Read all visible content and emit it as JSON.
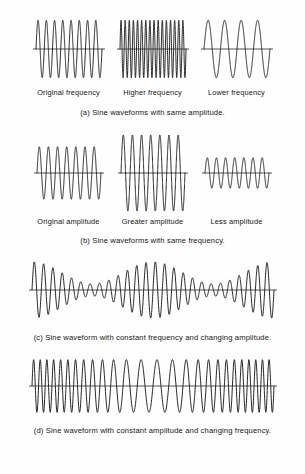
{
  "figure": {
    "ink_color": "#1a1a1a",
    "background_color": "#fefefe",
    "axis_color": "#2b2b2b"
  },
  "chart_data": {
    "type": "line",
    "grid": false,
    "legend": "none",
    "axis_style": "horizontal zero-line only, no ticks, no tick labels",
    "xlabel": "",
    "ylabel": "",
    "panels": [
      {
        "id": "a",
        "caption": "(a) Sine waveforms with same amplitude.",
        "shared_property": "amplitude",
        "varied_property": "frequency",
        "plots": [
          {
            "label": "Original frequency",
            "waveform": "sine",
            "cycles": 8,
            "amplitude": 1.0,
            "ylim": [
              -1.15,
              1.15
            ],
            "width": 74,
            "height": 70
          },
          {
            "label": "Higher frequency",
            "waveform": "sine",
            "cycles": 16,
            "amplitude": 1.0,
            "ylim": [
              -1.15,
              1.15
            ],
            "width": 74,
            "height": 70
          },
          {
            "label": "Lower frequency",
            "waveform": "sine",
            "cycles": 4,
            "amplitude": 1.0,
            "ylim": [
              -1.15,
              1.15
            ],
            "width": 74,
            "height": 70
          }
        ]
      },
      {
        "id": "b",
        "caption": "(b) Sine waveforms with same frequency.",
        "shared_property": "frequency",
        "varied_property": "amplitude",
        "plots": [
          {
            "label": "Original amplitude",
            "waveform": "sine",
            "cycles": 7,
            "amplitude": 1.0,
            "ylim": [
              -1.45,
              1.45
            ],
            "width": 72,
            "height": 80
          },
          {
            "label": "Greater amplitude",
            "waveform": "sine",
            "cycles": 7,
            "amplitude": 1.45,
            "ylim": [
              -1.45,
              1.45
            ],
            "width": 72,
            "height": 80
          },
          {
            "label": "Less amplitude",
            "waveform": "sine",
            "cycles": 7,
            "amplitude": 0.58,
            "ylim": [
              -1.45,
              1.45
            ],
            "width": 72,
            "height": 80
          }
        ]
      },
      {
        "id": "c",
        "caption": "(c) Sine waveform with constant frequency and changing amplitude.",
        "shared_property": "frequency",
        "varied_property": "amplitude",
        "plots": [
          {
            "label": "",
            "waveform": "amplitude-modulated-sine",
            "carrier_cycles": 26,
            "envelope_cycles": 2,
            "envelope_min": 0.22,
            "envelope_max": 1.0,
            "amplitude": 1.0,
            "ylim": [
              -1.1,
              1.1
            ],
            "width": 250,
            "height": 66
          }
        ]
      },
      {
        "id": "d",
        "caption": "(d) Sine waveform with constant amplitude and changing frequency.",
        "shared_property": "amplitude",
        "varied_property": "frequency",
        "plots": [
          {
            "label": "",
            "waveform": "frequency-modulated-sine",
            "base_cycles": 26,
            "modulation_cycles": 1,
            "modulation_depth": 0.42,
            "amplitude": 1.0,
            "ylim": [
              -1.1,
              1.1
            ],
            "width": 250,
            "height": 62
          }
        ]
      }
    ]
  }
}
